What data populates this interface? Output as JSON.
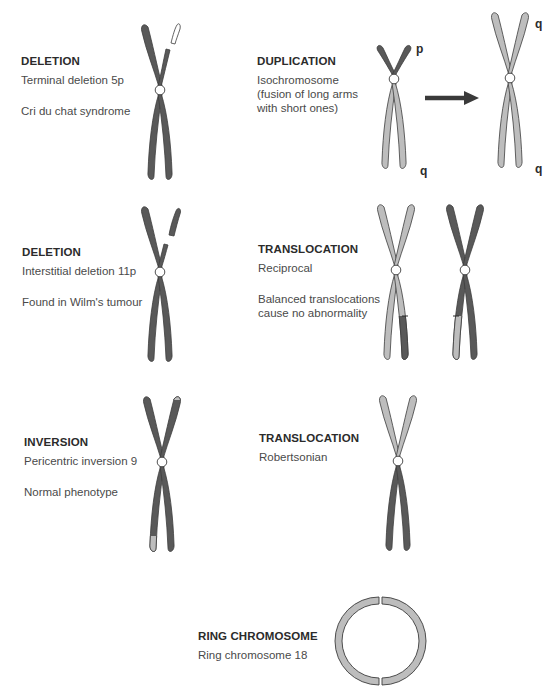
{
  "colors": {
    "dark_chromatin": "#595959",
    "light_chromatin": "#bdbdbd",
    "outline": "#3c3c3c",
    "centromere_fill": "#ffffff",
    "deleted_segment_fill": "#ffffff",
    "arrow": "#3a3a3a",
    "text": "#3a3a3a"
  },
  "panels": {
    "deletion_terminal": {
      "title": "DELETION",
      "line1": "Terminal deletion 5p",
      "line2": "Cri du chat syndrome"
    },
    "duplication": {
      "title": "DUPLICATION",
      "line1": "Isochromosome\n(fusion of long arms\nwith short ones)",
      "arm_labels": {
        "p": "p",
        "q_left": "q",
        "q_right_top": "q",
        "q_right_bottom": "q"
      }
    },
    "deletion_interstitial": {
      "title": "DELETION",
      "line1": "Interstitial deletion 11p",
      "line2": "Found in Wilm's tumour"
    },
    "translocation_reciprocal": {
      "title": "TRANSLOCATION",
      "line1": "Reciprocal",
      "line2": "Balanced translocations\ncause no abnormality"
    },
    "inversion": {
      "title": "INVERSION",
      "line1": "Pericentric inversion 9",
      "line2": "Normal phenotype"
    },
    "translocation_robertsonian": {
      "title": "TRANSLOCATION",
      "line1": "Robertsonian"
    },
    "ring": {
      "title": "RING CHROMOSOME",
      "line1": "Ring chromosome 18"
    }
  }
}
